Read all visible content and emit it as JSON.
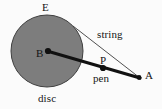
{
  "figure": {
    "kind": "geometry-diagram",
    "background_color": "#fbfbfb",
    "disc": {
      "label_center": "B",
      "label_below": "disc",
      "label_above": "E",
      "fill_color": "#7d7d7d",
      "stroke_color": "#3a3a3a",
      "center_x": 47,
      "center_y": 51,
      "radius": 36
    },
    "points": [
      {
        "id": "B",
        "label": "B",
        "x": 47,
        "y": 51
      },
      {
        "id": "P",
        "label": "P",
        "x": 103,
        "y": 70
      },
      {
        "id": "A",
        "label": "A",
        "x": 140,
        "y": 78
      }
    ],
    "labels": {
      "E": "E",
      "B": "B",
      "disc": "disc",
      "string": "string",
      "P": "P",
      "pen": "pen",
      "A": "A"
    },
    "segments": [
      {
        "id": "rod",
        "name": "rod-B-to-A",
        "from": "B",
        "to": "A",
        "stroke_color": "#111111",
        "stroke_width": 3.2
      },
      {
        "id": "string",
        "name": "string-tangent-to-A",
        "label": "string",
        "from_x": 73,
        "from_y": 26,
        "to_x": 140,
        "to_y": 78,
        "stroke_color": "#3c3c3c",
        "stroke_width": 0.9
      }
    ]
  }
}
